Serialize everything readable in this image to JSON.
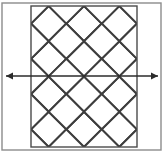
{
  "figure": {
    "canvas": {
      "width": 164,
      "height": 156
    },
    "outer_border": {
      "name": "outer-frame",
      "x": 2,
      "y": 3,
      "width": 159,
      "height": 147,
      "stroke": "#8c8c8c",
      "stroke_width": 1.4,
      "fill": "none"
    },
    "panel": {
      "name": "gray-panel",
      "x": 31,
      "y": 6,
      "width": 106,
      "height": 141,
      "fill": "#cfcfcf",
      "stroke": "#4a4a4a",
      "stroke_width": 1.4
    },
    "lattice": {
      "name": "diamond-lattice",
      "stroke": "#3d3d3d",
      "stroke_width": 2.0,
      "diamond_half_width": 17.7,
      "diamond_half_height": 17.6,
      "diamond_fill": "#ffffff",
      "columns": 3,
      "rows": 4,
      "center_x_values": [
        48.7,
        84.0,
        119.3
      ],
      "center_y_values": [
        23.5,
        58.8,
        94.0,
        129.3
      ],
      "half_center_x_values": [
        31.0,
        66.3,
        101.7,
        137.0
      ],
      "half_center_y_values": [
        6.0,
        41.2,
        76.4,
        111.7,
        147.0
      ]
    },
    "arrow": {
      "name": "horizontal-axis-arrow",
      "y": 76,
      "x_start": 6,
      "x_end": 158,
      "stroke": "#2b2b2b",
      "stroke_width": 1.5,
      "head_length": 7,
      "head_half_width": 3.4,
      "double_headed": true
    }
  }
}
